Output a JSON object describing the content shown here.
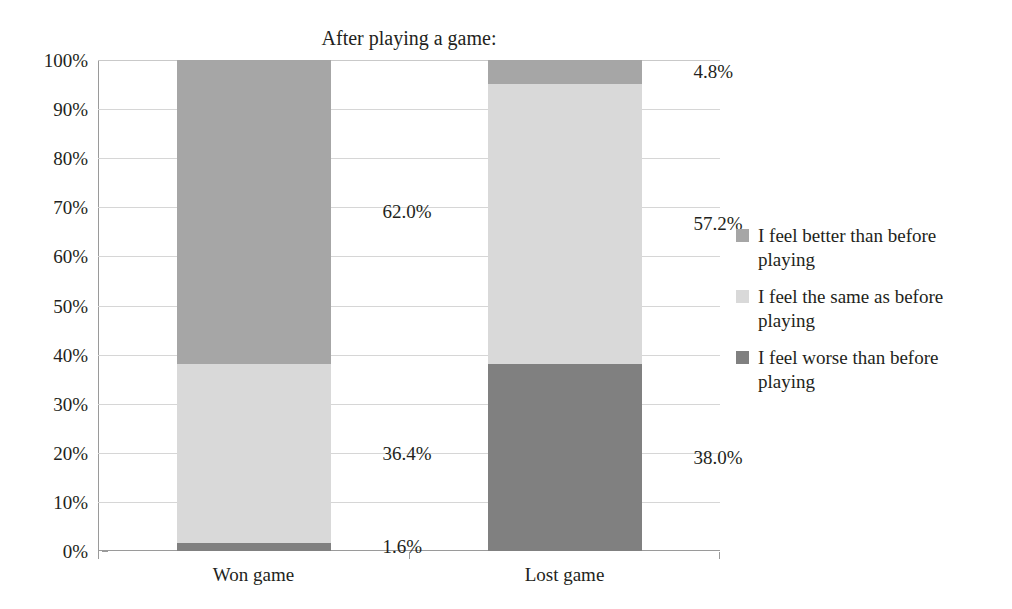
{
  "chart_data": {
    "type": "bar",
    "subtype": "stacked-bar-100pct",
    "title": "After playing a game:",
    "xlabel": "",
    "ylabel": "",
    "ylim": [
      0,
      100
    ],
    "ytick_labels": [
      "0%",
      "10%",
      "20%",
      "30%",
      "40%",
      "50%",
      "60%",
      "70%",
      "80%",
      "90%",
      "100%"
    ],
    "ytick_values": [
      0,
      10,
      20,
      30,
      40,
      50,
      60,
      70,
      80,
      90,
      100
    ],
    "grid": true,
    "legend_position": "right",
    "categories": [
      "Won game",
      "Lost game"
    ],
    "series": [
      {
        "name": "I feel worse than before playing",
        "color": "#808080",
        "values": [
          1.6,
          38.0
        ],
        "labels": [
          "1.6%",
          "38.0%"
        ]
      },
      {
        "name": "I feel the same as before playing",
        "color": "#d9d9d9",
        "values": [
          36.4,
          57.2
        ],
        "labels": [
          "36.4%",
          "57.2%"
        ]
      },
      {
        "name": "I feel better than before playing",
        "color": "#a6a6a6",
        "values": [
          62.0,
          4.8
        ],
        "labels": [
          "62.0%",
          "4.8%"
        ]
      }
    ],
    "legend_entries": [
      {
        "label": "I feel better than before playing",
        "color": "#a6a6a6"
      },
      {
        "label": "I feel the same as before playing",
        "color": "#d9d9d9"
      },
      {
        "label": "I feel worse than before playing",
        "color": "#808080"
      }
    ],
    "data_labels": [
      {
        "text": "62.0%",
        "category": "Won game",
        "series": "I feel better than before playing"
      },
      {
        "text": "36.4%",
        "category": "Won game",
        "series": "I feel the same as before playing"
      },
      {
        "text": "1.6%",
        "category": "Won game",
        "series": "I feel worse than before playing"
      },
      {
        "text": "4.8%",
        "category": "Lost game",
        "series": "I feel better than before playing"
      },
      {
        "text": "57.2%",
        "category": "Lost game",
        "series": "I feel the same as before playing"
      },
      {
        "text": "38.0%",
        "category": "Lost game",
        "series": "I feel worse than before playing"
      }
    ]
  }
}
